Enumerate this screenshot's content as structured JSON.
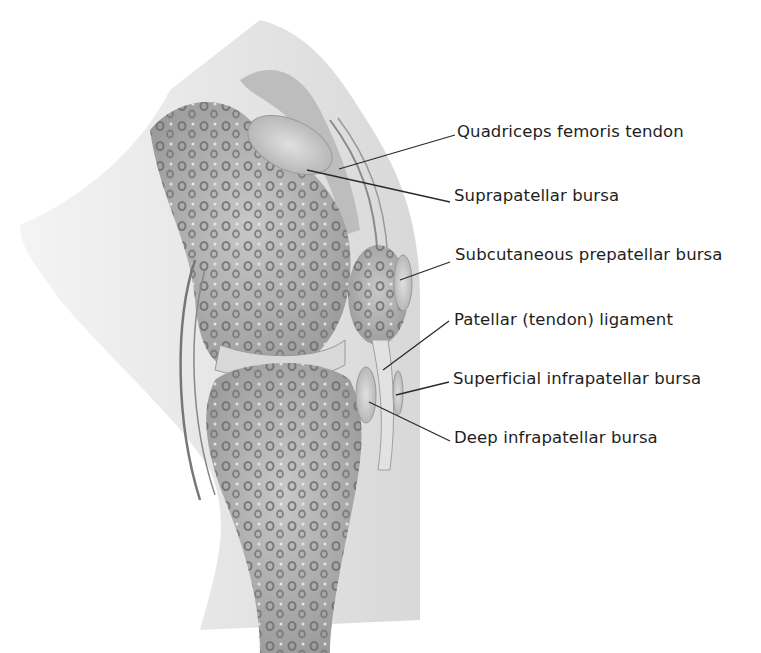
{
  "diagram": {
    "colors": {
      "background": "#ffffff",
      "skin": "#e6e6e6",
      "bone": "#a9a9a9",
      "bone_light": "#c4c4c4",
      "trabecula": "#7a7a7a",
      "bursa": "#cfcfcf",
      "leader_line": "#2a2a2a",
      "label_text": "#1e1e1e"
    },
    "labels": [
      {
        "id": "quadriceps",
        "text": "Quadriceps femoris tendon",
        "x": 457,
        "y": 122,
        "line": [
          [
            339,
            169
          ],
          [
            455,
            135
          ]
        ]
      },
      {
        "id": "suprapatellar",
        "text": "Suprapatellar bursa",
        "x": 454,
        "y": 186,
        "line": [
          [
            307,
            170
          ],
          [
            450,
            202
          ]
        ]
      },
      {
        "id": "prepatellar",
        "text": "Subcutaneous prepatellar bursa",
        "x": 455,
        "y": 245,
        "line": [
          [
            400,
            280
          ],
          [
            450,
            262
          ]
        ]
      },
      {
        "id": "patellar-ligament",
        "text": "Patellar (tendon) ligament",
        "x": 454,
        "y": 310,
        "line": [
          [
            383,
            370
          ],
          [
            449,
            321
          ]
        ]
      },
      {
        "id": "superficial-infrapatellar",
        "text": "Superficial infrapatellar bursa",
        "x": 453,
        "y": 369,
        "line": [
          [
            396,
            395
          ],
          [
            449,
            382
          ]
        ]
      },
      {
        "id": "deep-infrapatellar",
        "text": "Deep infrapatellar bursa",
        "x": 454,
        "y": 428,
        "line": [
          [
            369,
            402
          ],
          [
            450,
            441
          ]
        ]
      }
    ]
  }
}
